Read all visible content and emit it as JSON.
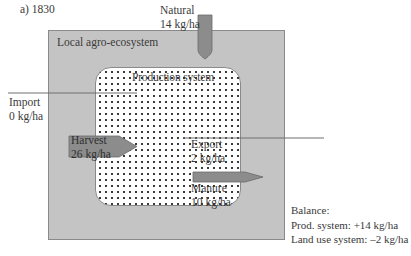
{
  "figure": {
    "panel_label": "a) 1830",
    "outer_box_label": "Local agro-ecosystem",
    "inner_box_label": "Production system",
    "colors": {
      "outer_fill": "#c4c4c4",
      "arrow_fill": "#8c8c8c",
      "line": "#6e6e6e",
      "dot": "#3a3a3a"
    }
  },
  "flows": {
    "natural": {
      "label": "Natural",
      "value": "14 kg/ha"
    },
    "import": {
      "label": "Import",
      "value": "0 kg/ha"
    },
    "harvest": {
      "label": "Harvest",
      "value": "26 kg/ha"
    },
    "export": {
      "label": "Export",
      "value": "2 kg/ha"
    },
    "manure": {
      "label": "Manure",
      "value": "10 kg/ha"
    }
  },
  "balance": {
    "title": "Balance:",
    "prod_system": "Prod. system: +14 kg/ha",
    "land_use_system": "Land use system: –2 kg/ha"
  }
}
